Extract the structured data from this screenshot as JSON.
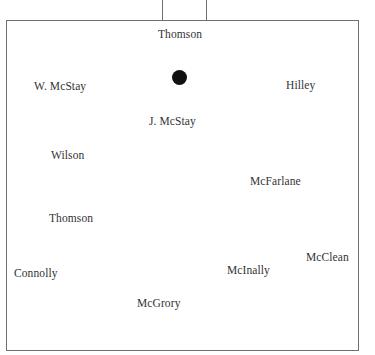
{
  "diagram": {
    "type": "team-formation",
    "ball_color": "#111111",
    "line_color": "#707070",
    "players": [
      {
        "name": "Thomson",
        "x": 158,
        "y": 27
      },
      {
        "name": "W. McStay",
        "x": 34,
        "y": 79
      },
      {
        "name": "Hilley",
        "x": 286,
        "y": 78
      },
      {
        "name": "J. McStay",
        "x": 149,
        "y": 114
      },
      {
        "name": "Wilson",
        "x": 51,
        "y": 148
      },
      {
        "name": "McFarlane",
        "x": 250,
        "y": 174
      },
      {
        "name": "Thomson",
        "x": 49,
        "y": 211
      },
      {
        "name": "McClean",
        "x": 306,
        "y": 250
      },
      {
        "name": "Connolly",
        "x": 14,
        "y": 266
      },
      {
        "name": "McInally",
        "x": 227,
        "y": 263
      },
      {
        "name": "McGrory",
        "x": 137,
        "y": 296
      }
    ]
  }
}
